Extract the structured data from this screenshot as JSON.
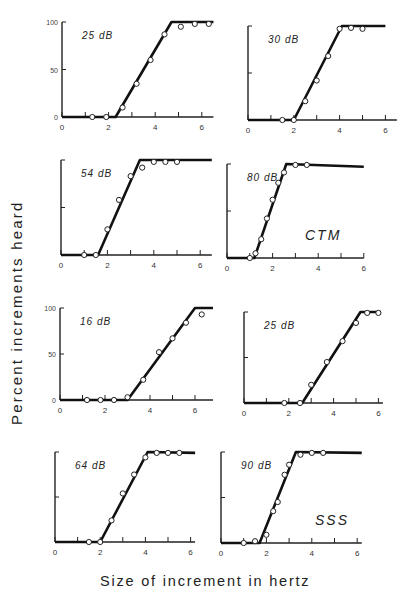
{
  "figure": {
    "ylabel": "Percent increments heard",
    "xlabel": "Size of increment in hertz",
    "caption_fragment": "...",
    "subject_labels": [
      "CTM",
      "SSS"
    ]
  },
  "chart_data": [
    {
      "type": "line",
      "subject": "CTM",
      "title": "25 dB",
      "panel": "row1-left",
      "xlabel": "Size of increment in hertz",
      "ylabel": "Percent increments heard",
      "xlim": [
        0,
        6.5
      ],
      "ylim": [
        0,
        100
      ],
      "xticks": [
        0,
        2,
        4,
        6
      ],
      "yticks": [
        0,
        50,
        100
      ],
      "yticklabels": [
        "0",
        "50",
        "100"
      ],
      "fit_line": [
        [
          0,
          0
        ],
        [
          2.3,
          0
        ],
        [
          4.7,
          100
        ],
        [
          6.5,
          100
        ]
      ],
      "points": [
        [
          1.3,
          0
        ],
        [
          1.9,
          0
        ],
        [
          2.6,
          10
        ],
        [
          3.2,
          35
        ],
        [
          3.8,
          60
        ],
        [
          4.4,
          87
        ],
        [
          5.1,
          95
        ],
        [
          5.7,
          98
        ],
        [
          6.3,
          98
        ]
      ]
    },
    {
      "type": "line",
      "subject": "CTM",
      "title": "30 dB",
      "panel": "row1-right",
      "xlim": [
        0,
        6.5
      ],
      "ylim": [
        0,
        100
      ],
      "xticks": [
        0,
        2,
        4,
        6
      ],
      "yticks": [
        0,
        50,
        100
      ],
      "fit_line": [
        [
          0,
          0
        ],
        [
          2.0,
          0
        ],
        [
          4.1,
          100
        ],
        [
          6.0,
          100
        ]
      ],
      "points": [
        [
          1.5,
          0
        ],
        [
          2.0,
          0
        ],
        [
          2.5,
          20
        ],
        [
          3.0,
          42
        ],
        [
          3.5,
          68
        ],
        [
          4.0,
          97
        ],
        [
          4.5,
          98
        ],
        [
          5.0,
          97
        ]
      ]
    },
    {
      "type": "line",
      "subject": "CTM",
      "title": "54 dB",
      "panel": "row2-left",
      "xlim": [
        0,
        6.5
      ],
      "ylim": [
        0,
        100
      ],
      "xticks": [
        0,
        2,
        4,
        6
      ],
      "yticks": [
        0,
        50,
        100
      ],
      "fit_line": [
        [
          0,
          0
        ],
        [
          1.6,
          0
        ],
        [
          3.4,
          100
        ],
        [
          6.5,
          100
        ]
      ],
      "points": [
        [
          1.0,
          0
        ],
        [
          1.5,
          0
        ],
        [
          2.0,
          27
        ],
        [
          2.5,
          58
        ],
        [
          3.0,
          83
        ],
        [
          3.5,
          92
        ],
        [
          4.0,
          98
        ],
        [
          4.5,
          98
        ],
        [
          5.0,
          98
        ]
      ]
    },
    {
      "type": "line",
      "subject": "CTM",
      "title": "80 dB",
      "panel": "row2-right",
      "xlim": [
        0,
        6.0
      ],
      "ylim": [
        0,
        100
      ],
      "xticks": [
        0,
        2,
        4,
        6
      ],
      "yticks": [
        0,
        50,
        100
      ],
      "fit_line": [
        [
          0,
          0
        ],
        [
          1.2,
          0
        ],
        [
          2.6,
          100
        ],
        [
          6.0,
          97
        ]
      ],
      "points": [
        [
          1.0,
          0
        ],
        [
          1.25,
          5
        ],
        [
          1.5,
          20
        ],
        [
          1.75,
          42
        ],
        [
          2.0,
          62
        ],
        [
          2.25,
          80
        ],
        [
          2.5,
          91
        ],
        [
          3.0,
          99
        ],
        [
          3.5,
          99
        ]
      ]
    },
    {
      "type": "line",
      "subject": "SSS",
      "title": "16 dB",
      "panel": "row3-left",
      "xlim": [
        0,
        6.8
      ],
      "ylim": [
        0,
        100
      ],
      "xticks": [
        0,
        2,
        4,
        6
      ],
      "yticks": [
        0,
        50,
        100
      ],
      "yticklabels": [
        "0",
        "50",
        "100"
      ],
      "fit_line": [
        [
          0,
          0
        ],
        [
          3.0,
          0
        ],
        [
          6.0,
          100
        ],
        [
          6.8,
          100
        ]
      ],
      "points": [
        [
          1.2,
          0
        ],
        [
          1.8,
          0
        ],
        [
          2.4,
          0
        ],
        [
          3.0,
          3
        ],
        [
          3.7,
          22
        ],
        [
          4.4,
          52
        ],
        [
          5.0,
          67
        ],
        [
          5.6,
          84
        ],
        [
          6.3,
          93
        ]
      ]
    },
    {
      "type": "line",
      "subject": "SSS",
      "title": "25 dB",
      "panel": "row3-right",
      "xlim": [
        0,
        6.2
      ],
      "ylim": [
        0,
        100
      ],
      "xticks": [
        0,
        2,
        4,
        6
      ],
      "yticks": [
        0,
        50,
        100
      ],
      "fit_line": [
        [
          0,
          0
        ],
        [
          2.6,
          0
        ],
        [
          5.2,
          100
        ],
        [
          6.1,
          100
        ]
      ],
      "points": [
        [
          1.8,
          0
        ],
        [
          2.5,
          0
        ],
        [
          3.0,
          20
        ],
        [
          3.7,
          45
        ],
        [
          4.4,
          68
        ],
        [
          5.0,
          88
        ],
        [
          5.5,
          99
        ],
        [
          6.0,
          99
        ]
      ]
    },
    {
      "type": "line",
      "subject": "SSS",
      "title": "64 dB",
      "panel": "row4-left",
      "xlim": [
        0,
        6.2
      ],
      "ylim": [
        0,
        100
      ],
      "xticks": [
        0,
        2,
        4,
        6
      ],
      "yticks": [
        0,
        50,
        100
      ],
      "fit_line": [
        [
          0,
          0
        ],
        [
          2.0,
          0
        ],
        [
          4.1,
          100
        ],
        [
          6.2,
          99
        ]
      ],
      "points": [
        [
          1.5,
          0
        ],
        [
          2.0,
          0
        ],
        [
          2.5,
          24
        ],
        [
          3.0,
          54
        ],
        [
          3.5,
          75
        ],
        [
          4.0,
          94
        ],
        [
          4.5,
          99
        ],
        [
          5.0,
          99
        ],
        [
          5.5,
          99
        ]
      ]
    },
    {
      "type": "line",
      "subject": "SSS",
      "title": "90 dB",
      "panel": "row4-right",
      "xlim": [
        0,
        6.2
      ],
      "ylim": [
        0,
        100
      ],
      "xticks": [
        0,
        2,
        4,
        6
      ],
      "yticks": [
        0,
        50,
        100
      ],
      "fit_line": [
        [
          0,
          0
        ],
        [
          1.7,
          0
        ],
        [
          3.3,
          100
        ],
        [
          6.2,
          99
        ]
      ],
      "points": [
        [
          1.0,
          0
        ],
        [
          1.5,
          2
        ],
        [
          2.0,
          9
        ],
        [
          2.3,
          35
        ],
        [
          2.5,
          45
        ],
        [
          2.8,
          75
        ],
        [
          3.0,
          86
        ],
        [
          3.5,
          97
        ],
        [
          4.0,
          99
        ],
        [
          4.5,
          99
        ]
      ]
    }
  ],
  "panels_layout": [
    {
      "x0": 62,
      "xs": 23.3,
      "y0": 117,
      "ytop": 22,
      "tick_labels": true
    },
    {
      "x0": 248,
      "xs": 22.9,
      "y0": 120,
      "ytop": 26,
      "tick_labels": false
    },
    {
      "x0": 61,
      "xs": 23.2,
      "y0": 255,
      "ytop": 160,
      "tick_labels": false
    },
    {
      "x0": 227,
      "xs": 22.8,
      "y0": 258,
      "ytop": 164,
      "tick_labels": false,
      "subject_label": "CTM",
      "lx": 305,
      "ly": 240
    },
    {
      "x0": 60,
      "xs": 22.5,
      "y0": 400,
      "ytop": 308,
      "tick_labels": true
    },
    {
      "x0": 244,
      "xs": 22.4,
      "y0": 403,
      "ytop": 312,
      "tick_labels": false
    },
    {
      "x0": 55,
      "xs": 22.6,
      "y0": 542,
      "ytop": 452,
      "tick_labels": false
    },
    {
      "x0": 221,
      "xs": 22.7,
      "y0": 543,
      "ytop": 452,
      "tick_labels": false,
      "subject_label": "SSS",
      "lx": 315,
      "ly": 525
    }
  ]
}
